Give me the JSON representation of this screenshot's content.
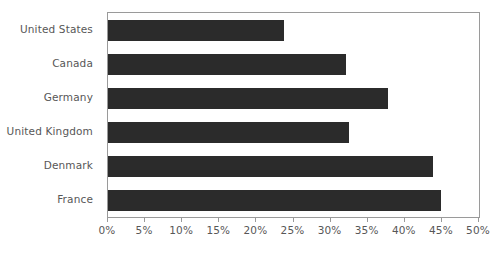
{
  "chart_data": {
    "type": "bar",
    "orientation": "horizontal",
    "title": "",
    "xlabel": "",
    "ylabel": "",
    "categories": [
      "United States",
      "Canada",
      "Germany",
      "United Kingdom",
      "Denmark",
      "France"
    ],
    "values": [
      23.7,
      32.1,
      37.7,
      32.5,
      43.8,
      44.9
    ],
    "xlim": [
      0,
      50
    ],
    "xtick_values": [
      0,
      5,
      10,
      15,
      20,
      25,
      30,
      35,
      40,
      45,
      50
    ],
    "xtick_labels": [
      "0%",
      "5%",
      "10%",
      "15%",
      "20%",
      "25%",
      "30%",
      "35%",
      "40%",
      "45%",
      "50%"
    ],
    "grid": false,
    "legend": null,
    "bar_color": "#2b2b2b",
    "axis_color": "#9a9a9a",
    "label_color": "#575757",
    "background": "#ffffff"
  }
}
